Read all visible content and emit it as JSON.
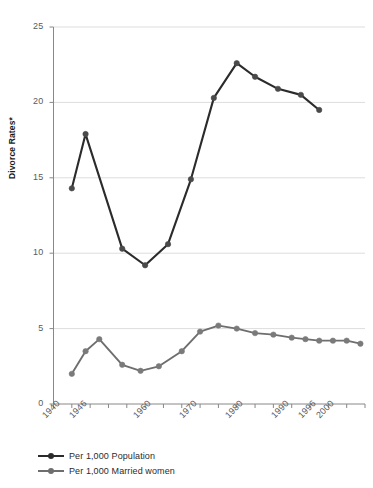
{
  "chart_data": {
    "type": "line",
    "title": "",
    "xlabel": "",
    "ylabel": "Divorce Rates*",
    "ylim": [
      0,
      25
    ],
    "xlim": [
      1940,
      2008
    ],
    "yticks": [
      0,
      5,
      10,
      15,
      20,
      25
    ],
    "ytick_labels": [
      "0",
      "5",
      "10",
      "15",
      "20",
      "25"
    ],
    "xticks": [
      1940,
      1944,
      1948,
      1952,
      1956,
      1960,
      1964,
      1968,
      1972,
      1976,
      1980,
      1984,
      1988,
      1992,
      1996,
      2000,
      2004,
      2008
    ],
    "xtick_labels": [
      "1940",
      "1946",
      "1960",
      "1970",
      "1980",
      "1990",
      "1996",
      "2000"
    ],
    "xtick_label_years": [
      1940,
      1946,
      1960,
      1970,
      1980,
      1990,
      1996,
      2000
    ],
    "grid": "horizontal",
    "legend_position": "bottom-left",
    "series": [
      {
        "name": "Per 1,000 Population",
        "color": "#2b2b2b",
        "marker_color": "#4a4a4a",
        "x": [
          1944,
          1947,
          1955,
          1960,
          1965,
          1970,
          1975,
          1980,
          1984,
          1989,
          1994,
          1998
        ],
        "values": [
          14.3,
          17.9,
          10.3,
          9.2,
          10.6,
          14.9,
          20.3,
          22.6,
          21.7,
          20.9,
          20.5,
          19.5
        ]
      },
      {
        "name": "Per 1,000 Married women",
        "color": "#6e6e6e",
        "marker_color": "#7a7a7a",
        "x": [
          1944,
          1947,
          1950,
          1955,
          1959,
          1963,
          1968,
          1972,
          1976,
          1980,
          1984,
          1988,
          1992,
          1995,
          1998,
          2001,
          2004,
          2007
        ],
        "values": [
          2.0,
          3.5,
          4.3,
          2.6,
          2.2,
          2.5,
          3.5,
          4.8,
          5.2,
          5.0,
          4.7,
          4.6,
          4.4,
          4.3,
          4.2,
          4.2,
          4.2,
          4.0
        ]
      }
    ]
  },
  "legend": {
    "items": [
      {
        "label": "Per 1,000 Population",
        "color": "#2b2b2b"
      },
      {
        "label": "Per 1,000 Married women",
        "color": "#6e6e6e"
      }
    ]
  },
  "axes": {
    "y_title": "Divorce Rates*",
    "axis_color": "#888888",
    "grid_color": "#dddddd",
    "tick_text_color": "#5a5a5a"
  }
}
